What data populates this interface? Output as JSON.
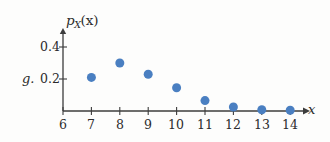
{
  "figure": {
    "item_label": "g.",
    "background_color": "#fdfdfc",
    "marker_color": "#4a7fc1",
    "axis_color": "#3c3c3c"
  },
  "chart_data": {
    "type": "scatter",
    "title": "",
    "xlabel": "x",
    "ylabel_main": "p",
    "ylabel_sub": "X",
    "ylabel_arg": "(x)",
    "ylabel_full": "p_X(x)",
    "x": [
      7,
      8,
      9,
      10,
      11,
      12,
      13,
      14
    ],
    "values": [
      0.21,
      0.3,
      0.23,
      0.145,
      0.065,
      0.025,
      0.008,
      0.005
    ],
    "xlim": [
      6,
      14.6
    ],
    "ylim": [
      0,
      0.5
    ],
    "xticks": [
      6,
      7,
      8,
      9,
      10,
      11,
      12,
      13,
      14
    ],
    "xticklabels": [
      "6",
      "7",
      "8",
      "9",
      "10",
      "11",
      "12",
      "13",
      "14"
    ],
    "yticks": [
      0.2,
      0.4
    ],
    "yticklabels": [
      "0.2",
      "0.4"
    ],
    "grid": false,
    "legend": null,
    "marker_color": "#4a7fc1",
    "marker_size": 9
  }
}
